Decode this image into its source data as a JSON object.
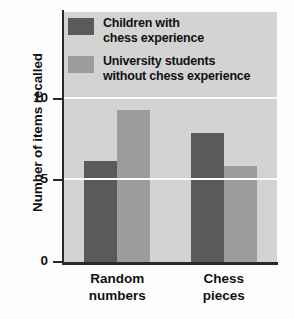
{
  "chart_data": {
    "type": "bar",
    "title": "",
    "xlabel": "",
    "ylabel": "Number of items recalled",
    "categories": [
      "Random\nnumbers",
      "Chess\npieces"
    ],
    "series": [
      {
        "name": "Children with\nchess experience",
        "color": "#5a5a5a",
        "values": [
          6.2,
          7.9
        ]
      },
      {
        "name": "University students\nwithout chess experience",
        "color": "#9c9c9c",
        "values": [
          9.3,
          5.9
        ]
      }
    ],
    "ylim": [
      0,
      15.3
    ],
    "yticks": [
      0,
      5,
      10
    ],
    "ytick_labels": [
      "0",
      "5",
      "10"
    ],
    "gridlines": [
      5,
      10
    ],
    "grid": true,
    "grid_color": "#fdfdfd",
    "legend_position": "top-left",
    "plot_background": "#d3d3d3"
  }
}
